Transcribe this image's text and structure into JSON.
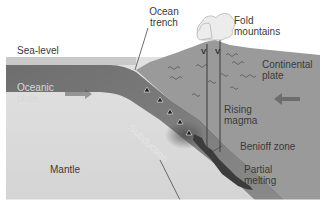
{
  "labels": {
    "sea_level": "Sea-level",
    "ocean_trench_line1": "Ocean",
    "ocean_trench_line2": "trench",
    "fold_mountains_line1": "Fold",
    "fold_mountains_line2": "mountains",
    "continental_plate_line1": "Continental",
    "continental_plate_line2": "plate",
    "oceanic_plate_line1": "Oceanic",
    "oceanic_plate_line2": "plate",
    "subduction": "Subduction",
    "rising_magma_line1": "Rising",
    "rising_magma_line2": "magma",
    "benioff_zone": "Benioff zone",
    "partial_melting_line1": "Partial",
    "partial_melting_line2": "melting",
    "mantle": "Mantle"
  },
  "colors": {
    "sea": "#c9c9c9",
    "oceanic_plate": "#6f6f6f",
    "continental_plate": "#9a9a9a",
    "mantle": "#d9d9d9",
    "melting_zone": "#3c3c3c",
    "magma_line": "#4a4a4a",
    "ash_cloud": "#ececec",
    "arrow": "#5a5a5a"
  }
}
